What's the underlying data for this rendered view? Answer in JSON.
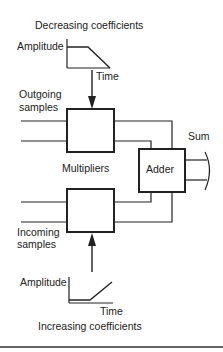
{
  "diagram": {
    "top_caption": "Decreasing coefficients",
    "bottom_caption": "Increasing coefficients",
    "top_graph": {
      "y_label": "Amplitude",
      "x_label": "Time"
    },
    "bottom_graph": {
      "y_label": "Amplitude",
      "x_label": "Time"
    },
    "outgoing_label_line1": "Outgoing",
    "outgoing_label_line2": "samples",
    "incoming_label_line1": "Incoming",
    "incoming_label_line2": "samples",
    "multipliers_label": "Multipliers",
    "adder_label": "Adder",
    "sum_label": "Sum",
    "stroke_color": "#222222",
    "background_color": "#ffffff"
  }
}
